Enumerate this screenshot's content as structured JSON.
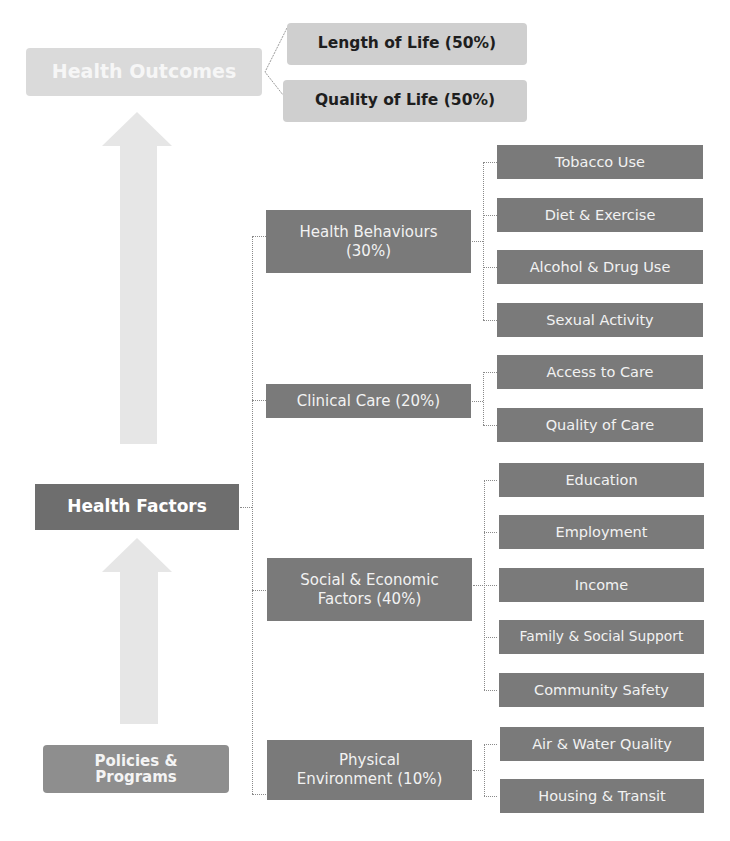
{
  "diagram": {
    "title_top": "Health Outcomes",
    "outcomes": [
      {
        "label": "Length of Life (50%)"
      },
      {
        "label": "Quality of Life (50%)"
      }
    ],
    "factors_root": "Health Factors",
    "policies": {
      "line1": "Policies &",
      "line2": "Programs"
    },
    "factors": [
      {
        "line1": "Health Behaviours",
        "line2": "(30%)",
        "children": [
          "Tobacco Use",
          "Diet & Exercise",
          "Alcohol & Drug Use",
          "Sexual Activity"
        ]
      },
      {
        "line1": "Clinical Care (20%)",
        "line2": "",
        "children": [
          "Access to Care",
          "Quality of Care"
        ]
      },
      {
        "line1": "Social & Economic",
        "line2": "Factors (40%)",
        "children": [
          "Education",
          "Employment",
          "Income",
          "Family & Social Support",
          "Community Safety"
        ]
      },
      {
        "line1": "Physical",
        "line2": "Environment (10%)",
        "children": [
          "Air & Water Quality",
          "Housing & Transit"
        ]
      }
    ],
    "arrows": [
      {
        "name": "factors-to-outcomes",
        "direction": "up"
      },
      {
        "name": "policies-to-factors",
        "direction": "up"
      }
    ],
    "colors": {
      "dark_box": "#7a7a7a",
      "outcome_box": "#cfcfcf",
      "health_outcomes_box": "#dadada",
      "arrow": "#e6e6e6",
      "connector": "#8a8a8a"
    }
  }
}
